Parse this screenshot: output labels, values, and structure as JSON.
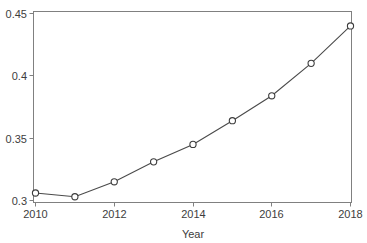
{
  "chart_data": {
    "type": "line",
    "title": "",
    "subtitle": "",
    "xlabel": "Year",
    "ylabel": "",
    "x": [
      2010,
      2011,
      2012,
      2013,
      2014,
      2015,
      2016,
      2017,
      2018
    ],
    "categories": [
      "2010",
      "2011",
      "2012",
      "2013",
      "2014",
      "2015",
      "2016",
      "2017",
      "2018"
    ],
    "series": [
      {
        "name": "",
        "values": [
          0.306,
          0.303,
          0.315,
          0.331,
          0.345,
          0.364,
          0.384,
          0.41,
          0.44
        ]
      }
    ],
    "xlim": [
      2010,
      2018
    ],
    "ylim": [
      0.3,
      0.45
    ],
    "xticks": [
      2010,
      2012,
      2014,
      2016,
      2018
    ],
    "xtick_labels": [
      "2010",
      "2012",
      "2014",
      "2016",
      "2018"
    ],
    "yticks": [
      0.3,
      0.35,
      0.4,
      0.45
    ],
    "ytick_labels": [
      "0.3",
      "0.35",
      "0.4",
      "0.45"
    ],
    "grid": false,
    "legend": false,
    "legend_position": "none",
    "marker": "open-circle",
    "colors": {
      "line": "#4a4a4a",
      "marker_fill": "#ffffff",
      "marker_stroke": "#3c3c3c",
      "axis": "#808080",
      "text": "#3d3d3d",
      "background": "#ffffff"
    }
  },
  "axis": {
    "y_labels": [
      "0.45",
      "0.4",
      "0.35",
      "0.3"
    ],
    "x_labels": [
      "2010",
      "2012",
      "2014",
      "2016",
      "2018"
    ],
    "x_title": "Year"
  }
}
